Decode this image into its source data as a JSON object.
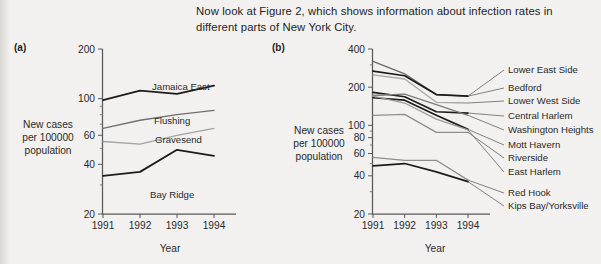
{
  "intro": {
    "text": "Now look at Figure 2, which shows information about infection rates in different parts of New York City."
  },
  "panel_a": {
    "tag": "(a)",
    "ylabel": "New cases\nper 100000\npopulation",
    "xlabel": "Year"
  },
  "panel_b": {
    "tag": "(b)",
    "ylabel": "New cases\nper 100000\npopulation",
    "xlabel": "Year"
  },
  "chart_data": [
    {
      "type": "line",
      "panel": "(a)",
      "title": "",
      "xlabel": "Year",
      "ylabel": "New cases per 100000 population",
      "x": [
        "1991",
        "1992",
        "1993",
        "1994"
      ],
      "yscale": "log",
      "ylim": [
        20,
        200
      ],
      "yticks": [
        20,
        40,
        60,
        100,
        200
      ],
      "ytick_labels": [
        "20",
        "40",
        "60",
        "100",
        "200"
      ],
      "grid": false,
      "legend": "inline-labels",
      "series": [
        {
          "name": "Jamaica East",
          "values": [
            98,
            112,
            107,
            120
          ],
          "color": "#1c1c1c",
          "width": 1.8
        },
        {
          "name": "Flushing",
          "values": [
            66,
            74,
            80,
            85
          ],
          "color": "#6f6f6f",
          "width": 1.3
        },
        {
          "name": "Gravesend",
          "values": [
            55,
            53,
            60,
            66
          ],
          "color": "#a3a3a3",
          "width": 1.3
        },
        {
          "name": "Bay Ridge",
          "values": [
            34,
            36,
            49,
            45
          ],
          "color": "#1c1c1c",
          "width": 1.8
        }
      ]
    },
    {
      "type": "line",
      "panel": "(b)",
      "title": "",
      "xlabel": "Year",
      "ylabel": "New cases per 100000 population",
      "x": [
        "1991",
        "1992",
        "1993",
        "1994"
      ],
      "yscale": "log",
      "ylim": [
        20,
        400
      ],
      "yticks": [
        20,
        40,
        60,
        80,
        100,
        200,
        400
      ],
      "ytick_labels": [
        "20",
        "40",
        "60",
        "80",
        "100",
        "200",
        "400"
      ],
      "grid": false,
      "legend": "right-leader-lines",
      "series": [
        {
          "name": "Lower East Side",
          "values": [
            320,
            255,
            175,
            170
          ],
          "color": "#6a6a6a",
          "width": 1.3
        },
        {
          "name": "Bedford",
          "values": [
            268,
            246,
            175,
            170
          ],
          "color": "#1c1c1c",
          "width": 1.7
        },
        {
          "name": "Lower West Side",
          "values": [
            250,
            232,
            152,
            150
          ],
          "color": "#a8a8a8",
          "width": 1.3
        },
        {
          "name": "Central Harlem",
          "values": [
            182,
            168,
            128,
            125
          ],
          "color": "#1c1c1c",
          "width": 1.7
        },
        {
          "name": "Washington Heights",
          "values": [
            172,
            176,
            146,
            120
          ],
          "color": "#7b7b7b",
          "width": 1.3
        },
        {
          "name": "Mott Havern",
          "values": [
            165,
            158,
            120,
            93
          ],
          "color": "#1c1c1c",
          "width": 1.7
        },
        {
          "name": "Riverside",
          "values": [
            120,
            122,
            88,
            88
          ],
          "color": "#8e8e8e",
          "width": 1.3
        },
        {
          "name": "East Harlem",
          "values": [
            170,
            150,
            112,
            92
          ],
          "color": "#9c9c9c",
          "width": 1.3
        },
        {
          "name": "Red Hook",
          "values": [
            56,
            53,
            53,
            37
          ],
          "color": "#8e8e8e",
          "width": 1.3
        },
        {
          "name": "Kips Bay/Yorksville",
          "values": [
            48,
            50,
            43,
            36
          ],
          "color": "#1c1c1c",
          "width": 1.7
        }
      ]
    }
  ]
}
